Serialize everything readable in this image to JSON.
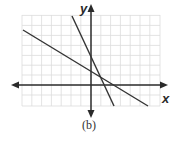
{
  "figure": {
    "caption": "(b)",
    "x_axis_label": "x",
    "y_axis_label": "y"
  },
  "colors": {
    "grid": "#d9d9d9",
    "axes": "#2a2a2a",
    "lines": "#333333",
    "background": "#ffffff"
  },
  "grid": {
    "x_min": -7,
    "x_max": 7,
    "y_min": -2,
    "y_max": 7,
    "cell_px": 9.8,
    "origin_px": [
      91,
      85
    ]
  },
  "lines": [
    {
      "name": "shallow-line",
      "from": [
        -6.9,
        5.6
      ],
      "to": [
        5.9,
        -2.2
      ],
      "y_intercept": 1.3,
      "x_intercept": 2.7
    },
    {
      "name": "steep-line",
      "from": [
        -2.0,
        7.0
      ],
      "to": [
        2.3,
        -2.2
      ],
      "y_intercept": 2.9,
      "x_intercept": 1.3
    }
  ],
  "intersection": [
    0.9,
    0.7
  ]
}
